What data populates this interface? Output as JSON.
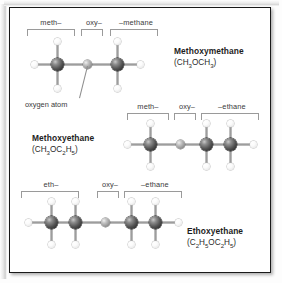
{
  "figure": {
    "background": "#ffffff",
    "border_color": "#1a1a1a",
    "atom_colors": {
      "carbon": "#2c2c2c",
      "oxygen": "#9d9d9d",
      "hydrogen": "#ffffff",
      "bond": "#9d9d9d"
    },
    "callout": {
      "label": "oxygen atom"
    }
  },
  "molecules": [
    {
      "id": "methoxymethane",
      "name": "Methoxymethane",
      "formula_html": "(CH<sub>3</sub>OCH<sub>3</sub>)",
      "formula_text": "(CH3OCH3)",
      "segments": [
        {
          "label": "meth–"
        },
        {
          "label": "oxy–"
        },
        {
          "label": "–methane"
        }
      ],
      "skeleton": "C-O-C",
      "heavy_atoms": [
        "C",
        "O",
        "C"
      ]
    },
    {
      "id": "methoxyethane",
      "name": "Methoxyethane",
      "formula_html": "(CH<sub>3</sub>OC<sub>2</sub>H<sub>5</sub>)",
      "formula_text": "(CH3OC2H5)",
      "segments": [
        {
          "label": "meth–"
        },
        {
          "label": "oxy–"
        },
        {
          "label": "–ethane"
        }
      ],
      "skeleton": "C-O-C-C",
      "heavy_atoms": [
        "C",
        "O",
        "C",
        "C"
      ]
    },
    {
      "id": "ethoxyethane",
      "name": "Ethoxyethane",
      "formula_html": "(C<sub>2</sub>H<sub>5</sub>OC<sub>2</sub>H<sub>5</sub>)",
      "formula_text": "(C2H5OC2H5)",
      "segments": [
        {
          "label": "eth–"
        },
        {
          "label": "oxy–"
        },
        {
          "label": "–ethane"
        }
      ],
      "skeleton": "C-C-O-C-C",
      "heavy_atoms": [
        "C",
        "C",
        "O",
        "C",
        "C"
      ]
    }
  ]
}
